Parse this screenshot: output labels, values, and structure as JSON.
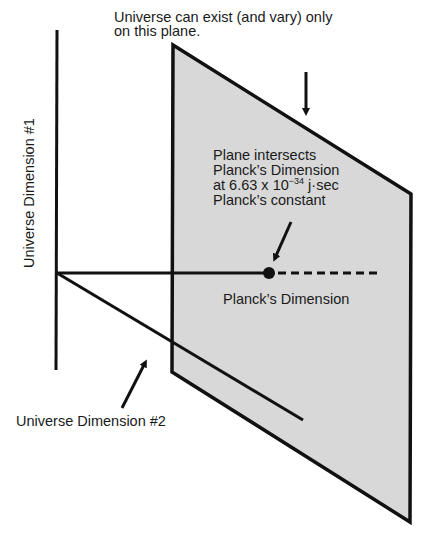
{
  "diagram": {
    "top_label_line1": "Universe can exist (and vary) only",
    "top_label_line2": "on this plane.",
    "intersect_line1": "Plane intersects",
    "intersect_line2": "Planck’s Dimension",
    "intersect_line3_pre": "at 6.63 x 10",
    "intersect_line3_exp": "−34",
    "intersect_line3_post": " j·sec",
    "intersect_line4": "Planck’s constant",
    "planck_dimension_label": "Planck’s Dimension",
    "dimension1_label": "Universe Dimension #1",
    "dimension2_label": "Universe Dimension #2",
    "colors": {
      "plane_fill": "#d8d8d8",
      "line": "#111111",
      "background": "#ffffff"
    }
  }
}
